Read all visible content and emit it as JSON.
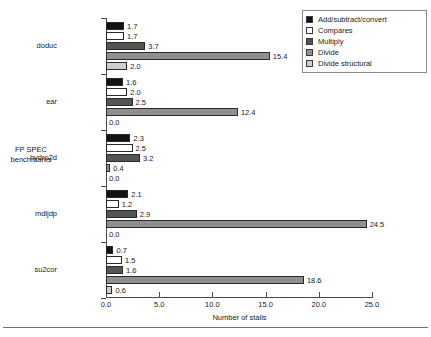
{
  "chart_data": {
    "type": "bar",
    "orientation": "horizontal",
    "grouped": true,
    "title": "",
    "xlabel": "Number of stalls",
    "ylabel": "FP SPEC benchmarks",
    "xlim": [
      0.0,
      25.0
    ],
    "xticks": [
      "0.0",
      "5.0",
      "10.0",
      "15.0",
      "20.0",
      "25.0"
    ],
    "xtick_values": [
      0.0,
      5.0,
      10.0,
      15.0,
      20.0,
      25.0
    ],
    "grid": false,
    "legend_position": "top-right",
    "categories": [
      "doduc",
      "ear",
      "hydro2d",
      "mdljdp",
      "su2cor"
    ],
    "series": [
      {
        "name": "Add/subtract/convert",
        "color": "#131313",
        "values": [
          1.7,
          1.6,
          2.3,
          2.1,
          0.7
        ],
        "labels": [
          "1.7",
          "1.6",
          "2.3",
          "2.1",
          "0.7"
        ]
      },
      {
        "name": "Compares",
        "color": "#ffffff",
        "values": [
          1.7,
          2.0,
          2.5,
          1.2,
          1.5
        ],
        "labels": [
          "1.7",
          "2.0",
          "2.5",
          "1.2",
          "1.5"
        ]
      },
      {
        "name": "Multiply",
        "color": "#545454",
        "values": [
          3.7,
          2.5,
          3.2,
          2.9,
          1.6
        ],
        "labels": [
          "3.7",
          "2.5",
          "3.2",
          "2.9",
          "1.6"
        ]
      },
      {
        "name": "Divide",
        "color": "#8f8f8f",
        "values": [
          15.4,
          12.4,
          0.4,
          24.5,
          18.6
        ],
        "labels": [
          "15.4",
          "12.4",
          "0.4",
          "24.5",
          "18.6"
        ]
      },
      {
        "name": "Divide structural",
        "color": "#cfcfcf",
        "values": [
          2.0,
          0.0,
          0.0,
          0.0,
          0.6
        ],
        "labels": [
          "2.0",
          "0.0",
          "0.0",
          "0.0",
          "0.6"
        ]
      }
    ]
  },
  "legend": {
    "items": [
      {
        "label": "Add/subtract/convert",
        "color": "#131313"
      },
      {
        "label": "Compares",
        "color": "#ffffff"
      },
      {
        "label": "Multiply",
        "color": "#545454"
      },
      {
        "label": "Divide",
        "color": "#8f8f8f"
      },
      {
        "label": "Divide structural",
        "color": "#cfcfcf"
      }
    ]
  }
}
